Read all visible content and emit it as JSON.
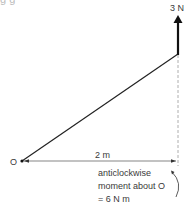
{
  "header_fragment": "g      g",
  "diagram": {
    "force_label": "3 N",
    "pivot_label": "O",
    "distance_label": "2 m",
    "moment_text": [
      "anticlockwise",
      "moment about O",
      "= 6 N m"
    ],
    "colors": {
      "line": "#222222",
      "dashed": "#999999",
      "text": "#3a3a3a"
    }
  }
}
